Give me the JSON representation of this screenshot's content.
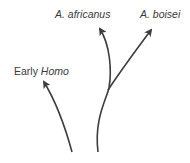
{
  "diagram": {
    "type": "phylogenetic-branching",
    "line_color": "#3d3d3d",
    "text_color": "#3a3a3a",
    "labels": {
      "africanus": "A. africanus",
      "boisei": "A. boisei",
      "homo_prefix": "Early ",
      "homo_genus": "Homo"
    },
    "branches": [
      {
        "name": "Early Homo",
        "from": [
          72,
          152
        ],
        "to": [
          44,
          82
        ]
      },
      {
        "name": "A. africanus",
        "from": [
          98,
          152
        ],
        "to": [
          99,
          28
        ]
      },
      {
        "name": "A. boisei",
        "from": [
          108,
          90
        ],
        "to": [
          152,
          28
        ]
      }
    ]
  }
}
